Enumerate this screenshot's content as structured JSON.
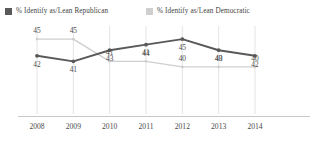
{
  "top_clipped_text": "",
  "legend": {
    "items": [
      {
        "label": "% Identify as/Lean Republican",
        "color": "#595959",
        "icon": "legend-swatch-icon"
      },
      {
        "label": "% Identify as/Lean Democratic",
        "color": "#cfcfcf",
        "icon": "legend-swatch-icon"
      }
    ]
  },
  "chart_data": {
    "type": "line",
    "title": "",
    "xlabel": "",
    "ylabel": "",
    "categories": [
      "2008",
      "2009",
      "2010",
      "2011",
      "2012",
      "2013",
      "2014"
    ],
    "x": [
      2008,
      2009,
      2010,
      2011,
      2012,
      2013,
      2014
    ],
    "ylim": [
      38,
      47
    ],
    "grid": "vertical",
    "legend_position": "top-left",
    "series": [
      {
        "name": "% Identify as/Lean Republican",
        "color": "#595959",
        "label_position": "below",
        "values": [
          42,
          41,
          43,
          44,
          45,
          43,
          42
        ]
      },
      {
        "name": "% Identify as/Lean Democratic",
        "color": "#cfcfcf",
        "label_position": "above",
        "values": [
          45,
          45,
          41,
          41,
          40,
          40,
          40
        ]
      }
    ]
  }
}
